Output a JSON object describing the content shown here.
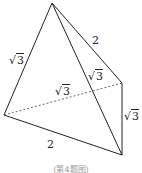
{
  "figure": {
    "vertices": {
      "apex": [
        52,
        3
      ],
      "left": [
        4,
        115
      ],
      "right": [
        122,
        83
      ],
      "bottom": [
        122,
        155
      ]
    },
    "edges": [
      {
        "from": "apex",
        "to": "left",
        "style": "solid",
        "label": "√3"
      },
      {
        "from": "apex",
        "to": "right",
        "style": "solid",
        "label": "2"
      },
      {
        "from": "apex",
        "to": "bottom",
        "style": "solid",
        "label": "√3"
      },
      {
        "from": "left",
        "to": "right",
        "style": "dashed",
        "label": "√3"
      },
      {
        "from": "right",
        "to": "bottom",
        "style": "solid",
        "label": "√3"
      },
      {
        "from": "left",
        "to": "bottom",
        "style": "solid",
        "label": "2"
      }
    ],
    "labels": {
      "apex_left": "3",
      "apex_right": "2",
      "apex_bottom": "3",
      "left_right": "3",
      "right_bottom": "3",
      "left_bottom": "2",
      "sqrt": "√"
    },
    "caption": "(第4题图)"
  }
}
